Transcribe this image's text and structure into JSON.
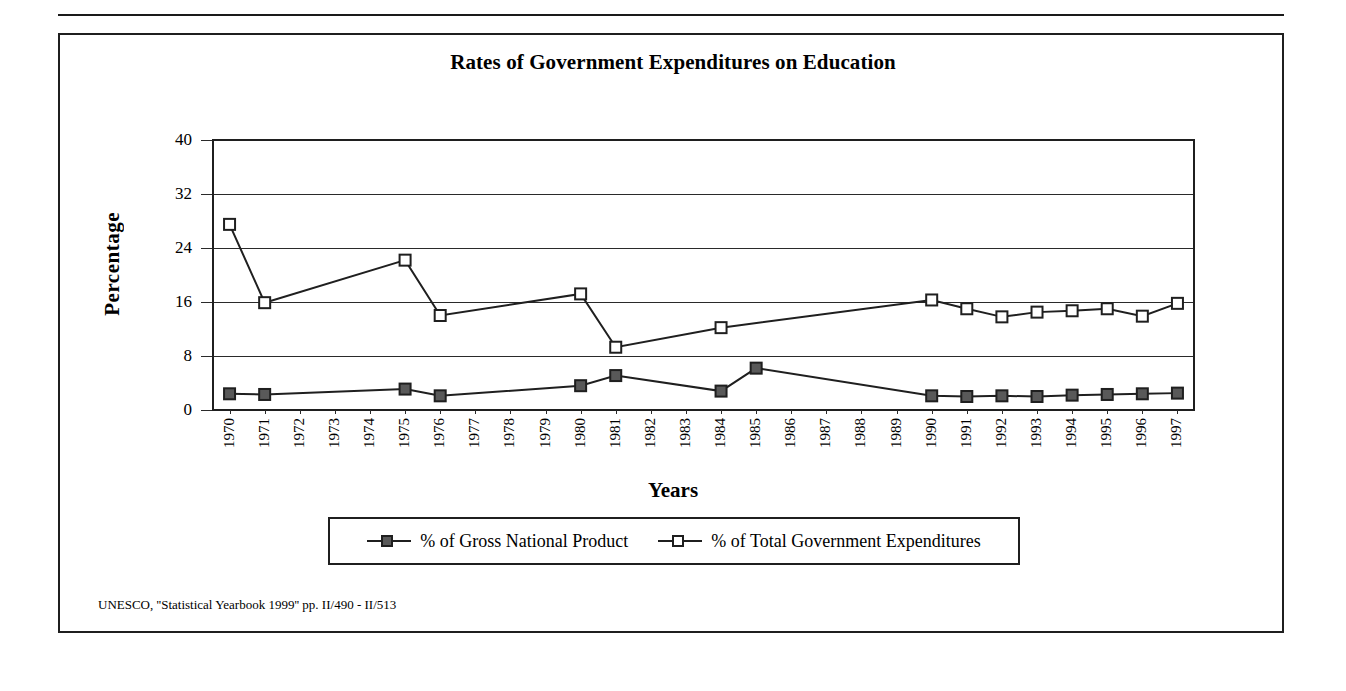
{
  "figure": {
    "title": "Rates of Government Expenditures on Education",
    "source_note": "UNESCO, ''Statistical Yearbook 1999'' pp. II/490 - II/513"
  },
  "chart_data": {
    "type": "line",
    "title": "Rates of Government Expenditures on Education",
    "xlabel": "Years",
    "ylabel": "Percentage",
    "ylim": [
      0,
      40
    ],
    "yticks": [
      0,
      8,
      16,
      24,
      32,
      40
    ],
    "grid": true,
    "legend_position": "bottom",
    "categories": [
      "1970",
      "1971",
      "1972",
      "1973",
      "1974",
      "1975",
      "1976",
      "1977",
      "1978",
      "1979",
      "1980",
      "1981",
      "1982",
      "1983",
      "1984",
      "1985",
      "1986",
      "1987",
      "1988",
      "1989",
      "1990",
      "1991",
      "1992",
      "1993",
      "1994",
      "1995",
      "1996",
      "1997"
    ],
    "series": [
      {
        "name": "% of Gross National Product",
        "marker": "filled-square",
        "values": [
          2.4,
          2.3,
          null,
          null,
          null,
          3.1,
          2.1,
          null,
          null,
          null,
          3.6,
          5.1,
          null,
          null,
          2.8,
          6.2,
          null,
          null,
          null,
          null,
          2.1,
          2.0,
          2.1,
          2.0,
          2.2,
          2.3,
          2.4,
          2.5
        ]
      },
      {
        "name": "% of Total Government Expenditures",
        "marker": "open-square",
        "values": [
          27.5,
          15.9,
          null,
          null,
          null,
          22.2,
          14.0,
          null,
          null,
          null,
          17.2,
          9.3,
          null,
          null,
          12.2,
          null,
          null,
          null,
          null,
          null,
          16.3,
          15.0,
          13.8,
          14.5,
          14.7,
          15.0,
          13.9,
          15.8
        ]
      }
    ]
  },
  "legend": {
    "items": [
      {
        "label": "% of Gross National Product",
        "marker": "filled-square"
      },
      {
        "label": "% of Total Government Expenditures",
        "marker": "open-square"
      }
    ]
  }
}
